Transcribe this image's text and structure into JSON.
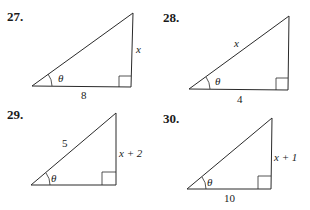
{
  "problems": [
    {
      "number": "27.",
      "angle_label": "θ",
      "sides": {
        "adjacent": "8",
        "opposite": "x",
        "hypotenuse": ""
      },
      "colors": {
        "stroke": "#2a2a2a"
      }
    },
    {
      "number": "28.",
      "angle_label": "θ",
      "sides": {
        "adjacent": "4",
        "opposite": "",
        "hypotenuse": "x"
      },
      "colors": {
        "stroke": "#2a2a2a"
      }
    },
    {
      "number": "29.",
      "angle_label": "θ",
      "sides": {
        "adjacent": "",
        "opposite": "x + 2",
        "hypotenuse": "5"
      },
      "colors": {
        "stroke": "#2a2a2a"
      }
    },
    {
      "number": "30.",
      "angle_label": "θ",
      "sides": {
        "adjacent": "10",
        "opposite": "x + 1",
        "hypotenuse": ""
      },
      "colors": {
        "stroke": "#2a2a2a"
      }
    }
  ]
}
